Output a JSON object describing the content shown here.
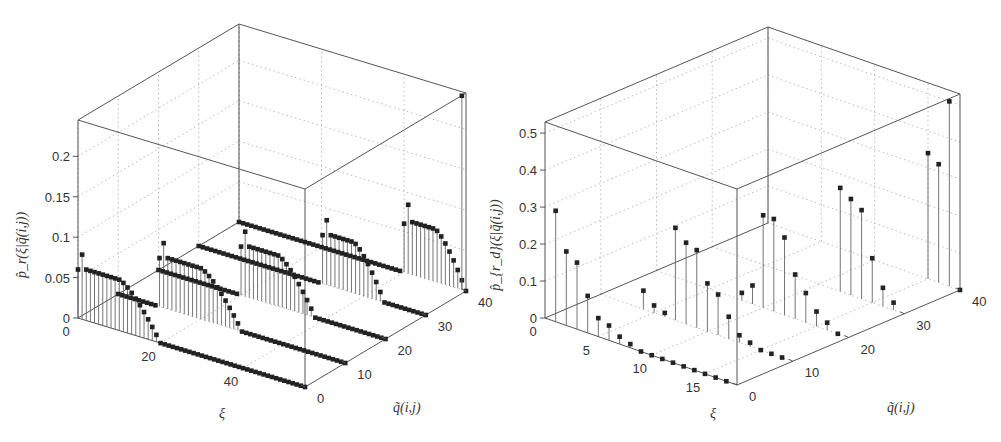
{
  "chart_data": [
    {
      "type": "stem3d",
      "panel": "left",
      "zlabel": "p̂_r(ξ|q̃(i,j))",
      "xlabel": "ξ",
      "ylabel": "q̃(i,j)",
      "xticks": [
        "0",
        "20",
        "40"
      ],
      "yticks": [
        "0",
        "10",
        "20",
        "30",
        "40"
      ],
      "zticks": [
        "0",
        "0.05",
        "0.1",
        "0.15",
        "0.2"
      ],
      "xlim": [
        0,
        55
      ],
      "ylim": [
        0,
        40
      ],
      "zlim": [
        0,
        0.245
      ],
      "grid": true,
      "series": [
        {
          "q": 0,
          "peak_xi_range": [
            0,
            20
          ],
          "peak_value": 0.08,
          "plateau": 0.063,
          "note": "rises near ξ≈0, decays to 0 by ξ≈25"
        },
        {
          "q": 10,
          "peak_xi_range": [
            10,
            30
          ],
          "peak_value": 0.08,
          "plateau": 0.063
        },
        {
          "q": 20,
          "peak_xi_range": [
            20,
            38
          ],
          "peak_value": 0.08,
          "plateau": 0.063
        },
        {
          "q": 30,
          "peak_xi_range": [
            30,
            45
          ],
          "peak_value": 0.08,
          "plateau": 0.063
        },
        {
          "q": 40,
          "peak_xi_range": [
            40,
            55
          ],
          "peak_value": 0.085,
          "plateau": 0.065,
          "note": "plus single spike ≈0.24 at ξ≈55"
        }
      ]
    },
    {
      "type": "stem3d",
      "panel": "right",
      "zlabel": "p̂_{r_d}(ξ|q̃(i,j))",
      "xlabel": "ξ",
      "ylabel": "q̃(i,j)",
      "xticks": [
        "0",
        "5",
        "10",
        "15"
      ],
      "yticks": [
        "0",
        "10",
        "20",
        "30",
        "40"
      ],
      "zticks": [
        "0",
        "0.1",
        "0.2",
        "0.3",
        "0.4",
        "0.5"
      ],
      "xlim": [
        0,
        18
      ],
      "ylim": [
        0,
        40
      ],
      "zlim": [
        0,
        0.53
      ],
      "grid": true,
      "series": [
        {
          "q": 0,
          "xi": [
            1,
            2,
            3,
            4,
            5,
            6,
            7,
            8,
            9,
            10,
            11,
            12,
            13,
            14,
            15,
            16,
            17
          ],
          "values": [
            0.3,
            0.2,
            0.18,
            0.1,
            0.05,
            0.04,
            0.02,
            0.01,
            0,
            0,
            0,
            0,
            0,
            0,
            0,
            0,
            0
          ]
        },
        {
          "q": 10,
          "xi": [
            4,
            5,
            6,
            7,
            8,
            9,
            10,
            11,
            12,
            13,
            14,
            15,
            16,
            17
          ],
          "values": [
            0.05,
            0.02,
            0.01,
            0.25,
            0.22,
            0.21,
            0.13,
            0.11,
            0.06,
            0.02,
            0.01,
            0,
            0,
            0
          ]
        },
        {
          "q": 20,
          "xi": [
            8,
            9,
            10,
            11,
            12,
            13,
            14,
            15,
            16,
            17
          ],
          "values": [
            0.02,
            0.05,
            0.25,
            0.25,
            0.21,
            0.12,
            0.08,
            0.04,
            0.02,
            0
          ]
        },
        {
          "q": 30,
          "xi": [
            12,
            13,
            14,
            15,
            16,
            17
          ],
          "values": [
            0.28,
            0.26,
            0.24,
            0.12,
            0.05,
            0.02
          ]
        },
        {
          "q": 40,
          "xi": [
            15,
            16,
            17,
            18
          ],
          "values": [
            0.34,
            0.32,
            0.5,
            0
          ]
        }
      ]
    }
  ]
}
